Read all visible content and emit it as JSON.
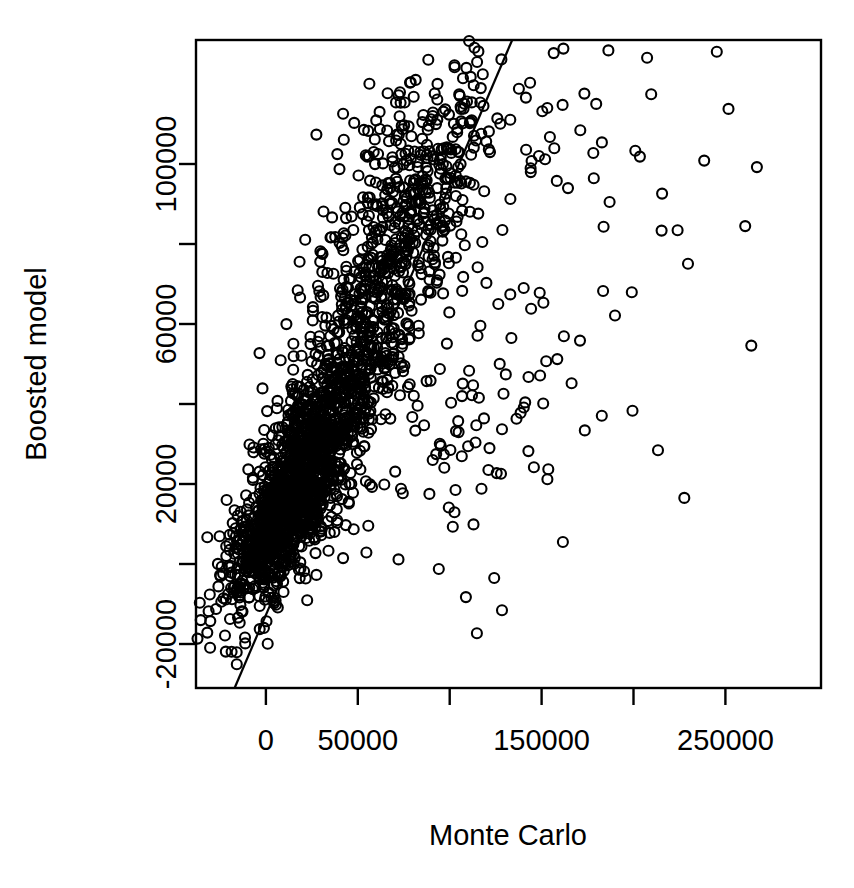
{
  "chart_data": {
    "type": "scatter",
    "title": "",
    "xlabel": "Monte Carlo",
    "ylabel": "Boosted model",
    "xlim": [
      -38000,
      302000
    ],
    "ylim": [
      -31000,
      131000
    ],
    "grid": false,
    "legend": null,
    "marker": {
      "shape": "open-circle",
      "color": "#000000",
      "fill": "none",
      "diameter_px": 10
    },
    "x_ticks": [
      {
        "value": 0,
        "label": "0"
      },
      {
        "value": 50000,
        "label": "50000"
      },
      {
        "value": 100000,
        "label": ""
      },
      {
        "value": 150000,
        "label": "150000"
      },
      {
        "value": 200000,
        "label": ""
      },
      {
        "value": 250000,
        "label": "250000"
      }
    ],
    "y_ticks": [
      {
        "value": -20000,
        "label": "-20000"
      },
      {
        "value": 0,
        "label": ""
      },
      {
        "value": 20000,
        "label": "20000"
      },
      {
        "value": 40000,
        "label": ""
      },
      {
        "value": 60000,
        "label": "60000"
      },
      {
        "value": 80000,
        "label": ""
      },
      {
        "value": 100000,
        "label": "100000"
      }
    ],
    "x_tick_labels": [
      "0",
      "50000",
      "",
      "150000",
      "",
      "250000"
    ],
    "y_tick_labels": [
      "-20000",
      "",
      "20000",
      "",
      "60000",
      "",
      "100000"
    ],
    "annotations": [
      {
        "name": "identity-reference-line",
        "type": "line",
        "description": "diagonal reference line",
        "x0": -17000,
        "y0": -31000,
        "x1": 134000,
        "y1": 131000
      }
    ],
    "series": [
      {
        "name": "Boosted model vs Monte Carlo",
        "n_points": 2400,
        "description": "Dense positively-correlated cloud concentrated at low values with a fan of high-x outliers",
        "clusters": [
          {
            "cx": 12000,
            "cy": 14000,
            "sx": 17000,
            "sy": 13000,
            "n": 900,
            "rho": 0.78
          },
          {
            "cx": 30000,
            "cy": 32000,
            "sx": 22000,
            "sy": 19000,
            "n": 620,
            "rho": 0.8
          },
          {
            "cx": 55000,
            "cy": 62000,
            "sx": 26000,
            "sy": 24000,
            "n": 430,
            "rho": 0.76
          },
          {
            "cx": 78000,
            "cy": 92000,
            "sx": 26000,
            "sy": 18000,
            "n": 230,
            "rho": 0.55
          },
          {
            "cx": 105000,
            "cy": 108000,
            "sx": 30000,
            "sy": 15000,
            "n": 95,
            "rho": 0.35
          },
          {
            "cx": 95000,
            "cy": 30000,
            "sx": 34000,
            "sy": 17000,
            "n": 85,
            "rho": 0.15
          },
          {
            "cx": 150000,
            "cy": 52000,
            "sx": 42000,
            "sy": 34000,
            "n": 28,
            "rho": 0.05
          },
          {
            "cx": 185000,
            "cy": 100000,
            "sx": 30000,
            "sy": 16000,
            "n": 22,
            "rho": 0.1
          },
          {
            "cx": 230000,
            "cy": 60000,
            "sx": 55000,
            "sy": 40000,
            "n": 10,
            "rho": 0.0
          }
        ]
      }
    ]
  },
  "plot_geometry": {
    "frame_left_px": 196,
    "frame_right_px": 821,
    "frame_top_px": 40,
    "frame_bottom_px": 688
  }
}
